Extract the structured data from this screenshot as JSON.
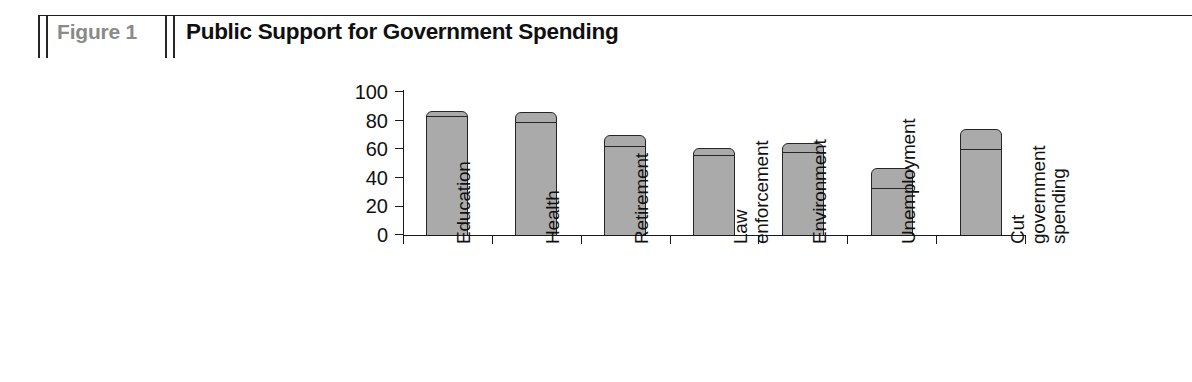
{
  "header": {
    "figure_number": "Figure 1",
    "title": "Public Support for Government Spending"
  },
  "chart_data": {
    "type": "bar",
    "title": "Public Support for Government Spending",
    "xlabel": "",
    "ylabel": "",
    "ylim": [
      0,
      100
    ],
    "yticks": [
      0,
      20,
      40,
      60,
      80,
      100
    ],
    "grid": false,
    "legend": "none",
    "orientation": "vertical",
    "stacked": true,
    "bar_style": "two-segment bar, gray fill with dark outline, rounded top",
    "categories": [
      "Education",
      "Health",
      "Retirement",
      "Law enforcement",
      "Environment",
      "Unemployment",
      "Cut government spending"
    ],
    "category_lines": [
      [
        "Education"
      ],
      [
        "Health"
      ],
      [
        "Retirement"
      ],
      [
        "Law",
        "enforcement"
      ],
      [
        "Environment"
      ],
      [
        "Unemployment"
      ],
      [
        "Cut",
        "government",
        "spending"
      ]
    ],
    "series": [
      {
        "name": "lower segment",
        "values": [
          83,
          79,
          62,
          56,
          58,
          33,
          60
        ]
      },
      {
        "name": "upper segment total",
        "values": [
          87,
          86,
          70,
          61,
          64,
          47,
          74
        ]
      }
    ],
    "values": [
      87,
      86,
      70,
      61,
      64,
      47,
      74
    ]
  },
  "colors": {
    "bar_fill": "#aaaaaa",
    "bar_outline": "#262626",
    "axis": "#1a1a1a",
    "figure_number_text": "#8a8a8a",
    "title_text": "#101010",
    "background": "#ffffff"
  }
}
